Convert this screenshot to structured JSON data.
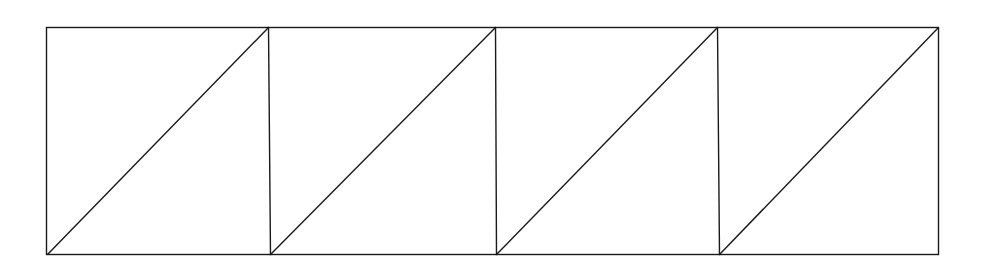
{
  "diagram": {
    "cell_count": 4,
    "cells": [
      {
        "id": 1,
        "diagonal": "bottom-left-to-top-right"
      },
      {
        "id": 2,
        "diagonal": "bottom-left-to-top-right"
      },
      {
        "id": 3,
        "diagonal": "bottom-left-to-top-right"
      },
      {
        "id": 4,
        "diagonal": "bottom-left-to-top-right"
      }
    ],
    "line_color": "#1a1a1a",
    "background_color": "#ffffff"
  }
}
